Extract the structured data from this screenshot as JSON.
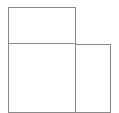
{
  "diagram": {
    "type": "rectangle-layout",
    "stroke_color": "#8a8a8a",
    "background": "#ffffff",
    "boxes": [
      {
        "id": "top-box",
        "x": 8,
        "y": 7,
        "w": 68,
        "h": 37
      },
      {
        "id": "bottom-left-box",
        "x": 8,
        "y": 43,
        "w": 68,
        "h": 70
      },
      {
        "id": "bottom-right-box",
        "x": 75,
        "y": 44,
        "w": 36,
        "h": 69
      }
    ]
  }
}
